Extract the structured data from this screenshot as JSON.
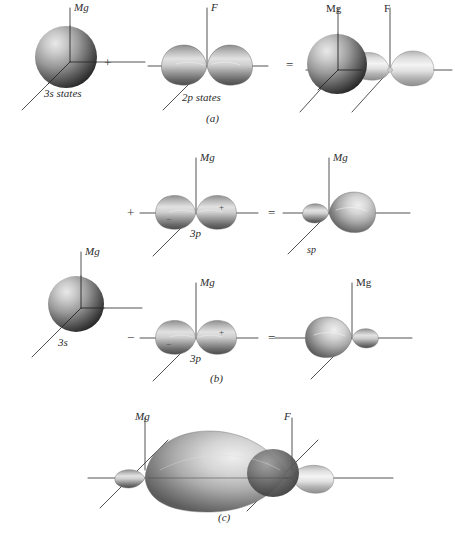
{
  "figure": {
    "title_absent": true,
    "captions": {
      "a": "(a)",
      "b": "(b)",
      "c": "(c)"
    },
    "background_color": "#ffffff",
    "ink_color": "#2b2b2b"
  },
  "panel_a": {
    "caption": "(a)",
    "items": [
      {
        "name": "3s-sphere",
        "label": "3s states",
        "axis_label": "Mg",
        "axis_label_style": "italic"
      },
      {
        "name": "2p-orbital",
        "label": "2p states",
        "axis_label": "F",
        "axis_label_style": "italic"
      },
      {
        "name": "combined-orbital",
        "label": "",
        "axis_labels": [
          "Mg",
          "F"
        ],
        "axis_label_style": "upright"
      }
    ],
    "operators": [
      "+",
      "="
    ]
  },
  "panel_b": {
    "caption": "(b)",
    "s_orbital": {
      "label": "3s",
      "axis_label": "Mg"
    },
    "rows": [
      {
        "operator": "+",
        "p_orbital": {
          "label": "3p",
          "axis_label": "Mg",
          "lobe_signs": {
            "left": "−",
            "right": "+"
          }
        },
        "equals": "=",
        "result": {
          "label": "sp",
          "axis_label": "Mg",
          "direction": "right"
        }
      },
      {
        "operator": "−",
        "p_orbital": {
          "label": "3p",
          "axis_label": "Mg",
          "lobe_signs": {
            "left": "−",
            "right": "+"
          }
        },
        "equals": "=",
        "result": {
          "label": "",
          "axis_label": "Mg",
          "direction": "left"
        }
      }
    ]
  },
  "panel_c": {
    "caption": "(c)",
    "axis_labels": [
      "Mg",
      "F"
    ],
    "description_absent": true
  }
}
